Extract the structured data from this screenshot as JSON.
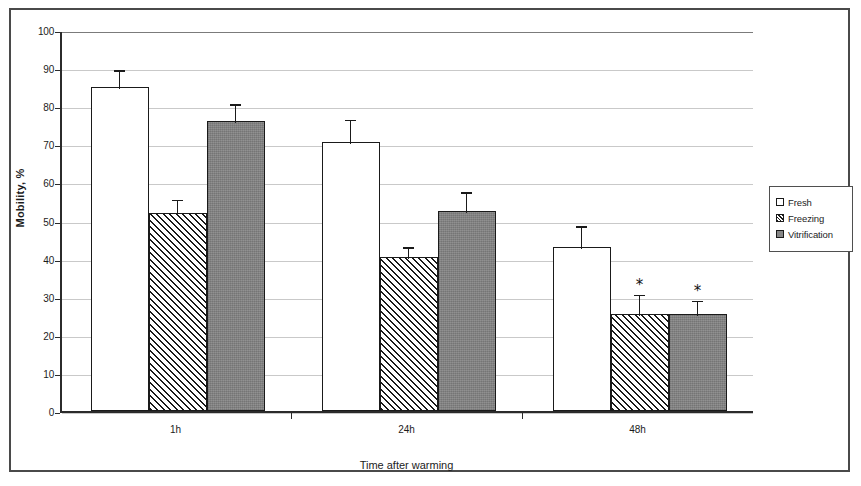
{
  "chart_data": {
    "type": "bar",
    "title": "",
    "xlabel": "Time after warming",
    "ylabel": "Mobility, %",
    "categories": [
      "1h",
      "24h",
      "48h"
    ],
    "ylim": [
      0,
      100
    ],
    "yticks": [
      0,
      10,
      20,
      30,
      40,
      50,
      60,
      70,
      80,
      90,
      100
    ],
    "grid": true,
    "legend_position": "right",
    "series": [
      {
        "name": "Fresh",
        "fill": "open",
        "values": [
          85,
          70.5,
          43
        ],
        "errors": [
          5,
          6.5,
          6
        ],
        "significance": [
          "",
          "",
          ""
        ]
      },
      {
        "name": "Freezing",
        "fill": "hatch",
        "values": [
          52,
          40.5,
          25.5
        ],
        "errors": [
          4,
          3,
          5.5
        ],
        "significance": [
          "",
          "",
          "*"
        ]
      },
      {
        "name": "Vitrification",
        "fill": "gray",
        "values": [
          76,
          52.5,
          25.5
        ],
        "errors": [
          5,
          5.5,
          4
        ],
        "significance": [
          "",
          "",
          "*"
        ]
      }
    ]
  },
  "legend": {
    "items": [
      {
        "label": "Fresh",
        "fill": "open"
      },
      {
        "label": "Freezing",
        "fill": "hatch"
      },
      {
        "label": "Vitrification",
        "fill": "gray"
      }
    ]
  },
  "colors": {
    "axis": "#2b2b2b",
    "grid": "#c9c9c9",
    "bar_outline": "#1a1a1a",
    "gray_fill": "#868686",
    "text": "#1c1c1c",
    "frame": "#4a4a4a"
  }
}
